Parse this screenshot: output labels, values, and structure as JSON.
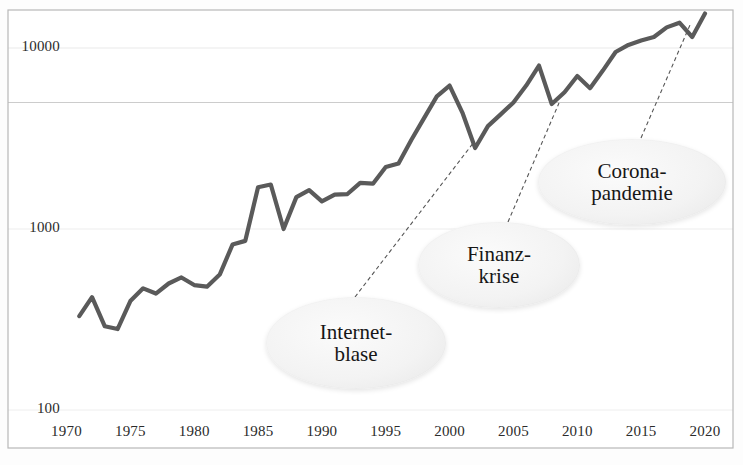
{
  "chart_data": {
    "type": "line",
    "title": "",
    "subtitle": "",
    "xlabel": "",
    "ylabel": "",
    "yscale": "log",
    "xlim": [
      1970,
      2020
    ],
    "ylim": [
      100,
      20000
    ],
    "grid": true,
    "grid_lines": [
      10000,
      5000,
      1000,
      100
    ],
    "legend": "none",
    "line_color": "#5a5a5a",
    "series": [
      {
        "name": "Index",
        "x": [
          1971,
          1972,
          1973,
          1974,
          1975,
          1976,
          1977,
          1978,
          1979,
          1980,
          1981,
          1982,
          1983,
          1984,
          1985,
          1986,
          1987,
          1988,
          1989,
          1990,
          1991,
          1992,
          1993,
          1994,
          1995,
          1996,
          1997,
          1998,
          1999,
          2000,
          2001,
          2002,
          2003,
          2004,
          2005,
          2006,
          2007,
          2008,
          2009,
          2010,
          2011,
          2012,
          2013,
          2014,
          2015,
          2016,
          2017,
          2018,
          2019,
          2020
        ],
        "values": [
          330,
          420,
          290,
          280,
          400,
          470,
          440,
          500,
          540,
          490,
          480,
          560,
          820,
          860,
          1700,
          1760,
          1000,
          1500,
          1640,
          1420,
          1550,
          1560,
          1800,
          1780,
          2200,
          2300,
          3100,
          4100,
          5400,
          6200,
          4400,
          2800,
          3700,
          4300,
          5000,
          6200,
          8000,
          4900,
          5700,
          7000,
          6000,
          7500,
          9500,
          10400,
          11000,
          11500,
          13000,
          13800,
          11500,
          15500
        ]
      }
    ],
    "ytick_labels": [
      "10000",
      "1000",
      "100"
    ],
    "ytick_values": [
      10000,
      1000,
      100
    ],
    "xtick_labels": [
      "1970",
      "1975",
      "1980",
      "1985",
      "1990",
      "1995",
      "2000",
      "2005",
      "2010",
      "2015",
      "2020"
    ],
    "xtick_values": [
      1970,
      1975,
      1980,
      1985,
      1990,
      1995,
      2000,
      2005,
      2010,
      2015,
      2020
    ],
    "annotations": [
      {
        "id": "internetblase",
        "lines": [
          "Internet-",
          "blase"
        ],
        "bubble_center": [
          356,
          343
        ],
        "bubble_size": [
          180,
          92
        ],
        "font_size": 21,
        "leader_from": [
          355,
          297
        ],
        "leader_to": [
          474,
          142
        ]
      },
      {
        "id": "finanzkrise",
        "lines": [
          "Finanz-",
          "krise"
        ],
        "bubble_center": [
          499,
          265
        ],
        "bubble_size": [
          162,
          86
        ],
        "font_size": 21,
        "leader_from": [
          508,
          222
        ],
        "leader_to": [
          559,
          103
        ]
      },
      {
        "id": "coronapandemie",
        "lines": [
          "Corona-",
          "pandemie"
        ],
        "bubble_center": [
          632,
          182
        ],
        "bubble_size": [
          188,
          86
        ],
        "font_size": 21,
        "leader_from": [
          641,
          138
        ],
        "leader_to": [
          690,
          25
        ]
      }
    ]
  },
  "plot_area": {
    "left": 8,
    "top": 10,
    "right": 733,
    "bottom": 448,
    "border_color": "#b8b8b8",
    "background": "#ffffff"
  }
}
